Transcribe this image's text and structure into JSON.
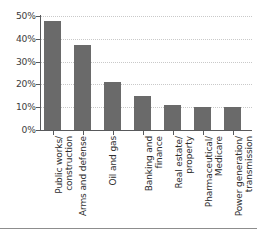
{
  "chart_data": {
    "type": "bar",
    "title": "",
    "subtitle": "",
    "xlabel": "",
    "ylabel": "",
    "ylim": [
      0,
      50
    ],
    "ytick_values": [
      50,
      40,
      30,
      20,
      10,
      0
    ],
    "ytick_labels": [
      "50%",
      "40%",
      "30%",
      "20%",
      "10%",
      "0%"
    ],
    "grid": true,
    "grid_axis": "y",
    "legend": false,
    "legend_position": "none",
    "bar_color": "#6a6a6a",
    "categories": [
      "Public works/construction",
      "Arms and defense",
      "Oil and gas",
      "Banking and finance",
      "Real estate/property",
      "Pharmaceutical/Medicare",
      "Power generation/transmission"
    ],
    "category_lines": [
      [
        "Public works/",
        "construction"
      ],
      [
        "Arms and defense",
        ""
      ],
      [
        "Oil and gas",
        ""
      ],
      [
        "Banking and",
        "finance"
      ],
      [
        "Real estate/",
        "property"
      ],
      [
        "Pharmaceutical/",
        "Medicare"
      ],
      [
        "Power generation/",
        "transmission"
      ]
    ],
    "values": [
      48,
      37.5,
      21,
      15,
      11,
      10.3,
      10.3
    ],
    "value_labels": [
      "48%",
      "37.5%",
      "21%",
      "15%",
      "11%",
      "10.3%",
      "10.3%"
    ]
  },
  "axis": {
    "y_axis_color": "#58595b",
    "x_axis_color": "#58595b",
    "gridline_color": "#c9c9c9"
  },
  "footer": {
    "rule_color": "#8d8d8d"
  }
}
